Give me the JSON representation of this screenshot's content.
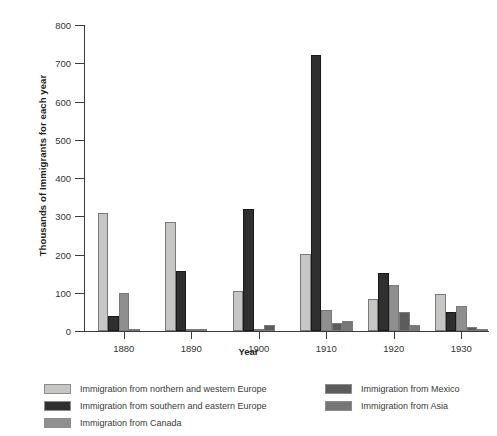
{
  "chart_data": {
    "type": "bar",
    "title": "",
    "xlabel": "Year",
    "ylabel": "Thousands of Immigrants for each year",
    "categories": [
      "1880",
      "1890",
      "1900",
      "1910",
      "1920",
      "1930"
    ],
    "ylim": [
      0,
      800
    ],
    "yticks": [
      0,
      100,
      200,
      300,
      400,
      500,
      600,
      700,
      800
    ],
    "ytick_labels": [
      "0",
      "100",
      "200",
      "300",
      "400",
      "500",
      "600",
      "700",
      "800"
    ],
    "grid": false,
    "legend_position": "bottom",
    "series": [
      {
        "name": "Immigration from northern and western Europe",
        "color": "#c6c6c4",
        "values": [
          308,
          286,
          104,
          202,
          85,
          96
        ]
      },
      {
        "name": "Immigration from southern and eastern Europe",
        "color": "#2f2f2f",
        "values": [
          38,
          158,
          320,
          722,
          152,
          51
        ]
      },
      {
        "name": "Immigration from Canada",
        "color": "#8f8f8f",
        "values": [
          100,
          2,
          2,
          56,
          120,
          65
        ]
      },
      {
        "name": "Immigration from Mexico",
        "color": "#5c5c5c",
        "values": [
          5,
          1,
          16,
          20,
          50,
          11
        ]
      },
      {
        "name": "Immigration from Asia",
        "color": "#767676",
        "values": [
          0,
          0,
          0,
          25,
          17,
          6
        ]
      }
    ]
  },
  "legend": {
    "items": [
      {
        "label": "Immigration from northern and western Europe",
        "color": "#c6c6c4"
      },
      {
        "label": "Immigration from southern and eastern Europe",
        "color": "#2f2f2f"
      },
      {
        "label": "Immigration from Canada",
        "color": "#8f8f8f"
      },
      {
        "label": "Immigration from Mexico",
        "color": "#5c5c5c"
      },
      {
        "label": "Immigration from Asia",
        "color": "#767676"
      }
    ]
  }
}
